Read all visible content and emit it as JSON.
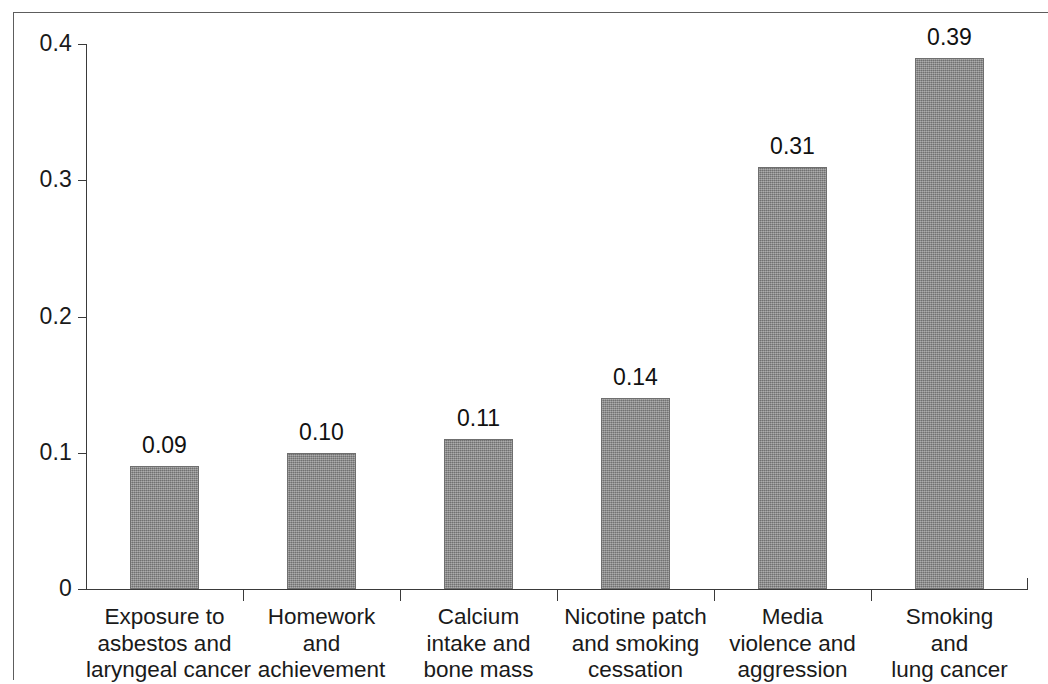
{
  "chart_data": {
    "type": "bar",
    "title": "",
    "subtitle": "",
    "xlabel": "",
    "ylabel": "",
    "ylim": [
      0,
      0.4
    ],
    "grid": false,
    "legend": null,
    "bar_color": "#8a8a8a",
    "axis_color": "#3a3a3a",
    "frame_color": "#5d5d5d",
    "categories": [
      "Exposure to asbestos and laryngeal cancer",
      "Homework and achievement",
      "Calcium intake and bone mass",
      "Nicotine patch and smoking cessation",
      "Media violence and aggression",
      "Smoking and lung cancer"
    ],
    "category_lines": [
      [
        "Exposure to",
        "asbestos and",
        "laryngeal cancer"
      ],
      [
        "Homework",
        "and",
        "achievement"
      ],
      [
        "Calcium",
        "intake and",
        "bone mass"
      ],
      [
        "Nicotine patch",
        "and smoking",
        "cessation"
      ],
      [
        "Media",
        "violence and",
        "aggression"
      ],
      [
        "Smoking",
        "and",
        "lung cancer"
      ]
    ],
    "values": [
      0.09,
      0.1,
      0.11,
      0.14,
      0.31,
      0.39
    ],
    "value_labels": [
      "0.09",
      "0.10",
      "0.11",
      "0.14",
      "0.31",
      "0.39"
    ],
    "yticks": [
      0,
      0.1,
      0.2,
      0.3,
      0.4
    ],
    "ytick_labels": [
      "0",
      "0.1",
      "0.2",
      "0.3",
      "0.4"
    ]
  }
}
